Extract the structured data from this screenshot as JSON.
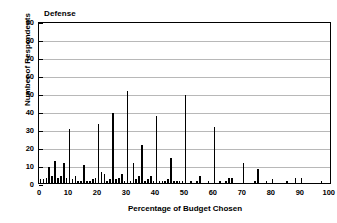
{
  "chart_data": {
    "type": "bar",
    "title": "Defense",
    "xlabel": "Percentage of Budget Chosen",
    "ylabel": "Number of Respondents",
    "xlim": [
      0,
      100
    ],
    "ylim": [
      0,
      90
    ],
    "xticks": [
      0,
      10,
      20,
      30,
      40,
      50,
      60,
      70,
      80,
      90,
      100
    ],
    "yticks": [
      0,
      10,
      20,
      30,
      40,
      50,
      60,
      70,
      80,
      90
    ],
    "grid": true,
    "legend": "none",
    "bar_color": "#000000",
    "categories": [
      0,
      1,
      2,
      3,
      4,
      5,
      6,
      7,
      8,
      9,
      10,
      11,
      12,
      13,
      14,
      15,
      16,
      17,
      18,
      19,
      20,
      21,
      22,
      23,
      24,
      25,
      26,
      27,
      28,
      29,
      30,
      31,
      32,
      33,
      34,
      35,
      36,
      37,
      38,
      39,
      40,
      41,
      42,
      43,
      44,
      45,
      46,
      47,
      48,
      49,
      50,
      51,
      52,
      53,
      54,
      55,
      56,
      57,
      58,
      59,
      60,
      61,
      62,
      63,
      64,
      65,
      66,
      67,
      68,
      69,
      70,
      71,
      72,
      73,
      74,
      75,
      76,
      77,
      78,
      79,
      80,
      81,
      82,
      83,
      84,
      85,
      86,
      87,
      88,
      89,
      90,
      91,
      92,
      93,
      94,
      95,
      96,
      97,
      98,
      99,
      100
    ],
    "values": [
      1,
      2,
      3,
      9,
      4,
      12,
      3,
      4,
      11,
      3,
      30,
      2,
      4,
      1,
      1,
      10,
      1,
      1,
      2,
      3,
      33,
      6,
      5,
      1,
      2,
      39,
      2,
      3,
      5,
      1,
      51,
      1,
      11,
      2,
      4,
      21,
      1,
      2,
      4,
      1,
      37,
      1,
      1,
      1,
      2,
      14,
      1,
      1,
      1,
      1,
      49,
      0,
      1,
      0,
      1,
      4,
      0,
      0,
      1,
      0,
      31,
      0,
      1,
      0,
      1,
      3,
      3,
      0,
      0,
      0,
      11,
      0,
      0,
      0,
      1,
      8,
      0,
      0,
      1,
      0,
      2,
      0,
      0,
      0,
      0,
      1,
      0,
      0,
      3,
      0,
      3,
      0,
      0,
      0,
      0,
      0,
      0,
      1,
      0,
      0,
      0
    ],
    "xtick_labels": [
      "0",
      "10",
      "20",
      "30",
      "40",
      "50",
      "60",
      "70",
      "80",
      "90",
      "100"
    ],
    "ytick_labels": [
      "0",
      "10",
      "20",
      "30",
      "40",
      "50",
      "60",
      "70",
      "80",
      "90"
    ]
  }
}
